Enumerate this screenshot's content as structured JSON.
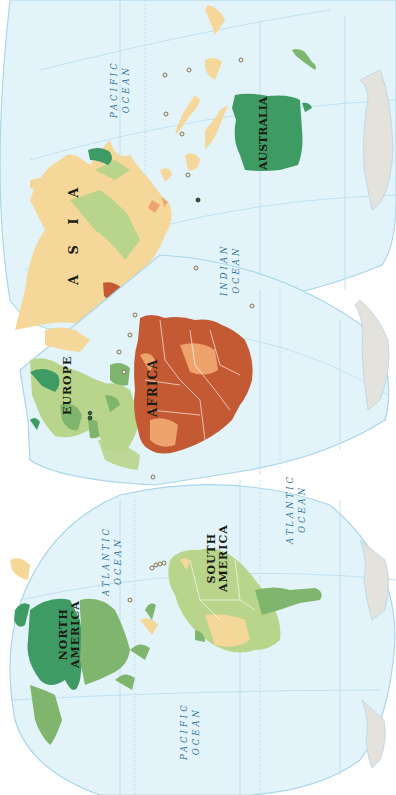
{
  "map": {
    "projection": "interrupted world map, rotated 90 degrees counter-clockwise",
    "colors": {
      "ocean": "#e3f3fa",
      "dark_green": "#3f9b64",
      "medium_green": "#7fb56c",
      "light_green": "#b9d48b",
      "tan": "#f5d79a",
      "light_orange": "#eea36c",
      "dark_orange": "#c45a33",
      "antarctica": "#e4e2dc"
    },
    "continents": [
      {
        "id": "asia",
        "label": "A S I A"
      },
      {
        "id": "europe",
        "label": "EUROPE"
      },
      {
        "id": "africa",
        "label": "AFRICA"
      },
      {
        "id": "australia",
        "label": "AUSTRALIA"
      },
      {
        "id": "north-america",
        "line1": "NORTH",
        "line2": "AMERICA"
      },
      {
        "id": "south-america",
        "line1": "SOUTH",
        "line2": "AMERICA"
      }
    ],
    "oceans": [
      {
        "id": "pacific-top",
        "line1": "PACIFIC",
        "line2": "OCEAN"
      },
      {
        "id": "indian",
        "line1": "INDIAN",
        "line2": "OCEAN"
      },
      {
        "id": "atlantic-north",
        "line1": "ATLANTIC",
        "line2": "OCEAN"
      },
      {
        "id": "atlantic-south",
        "line1": "ATLANTIC",
        "line2": "OCEAN"
      },
      {
        "id": "pacific-bottom",
        "line1": "PACIFIC",
        "line2": "OCEAN"
      }
    ]
  }
}
